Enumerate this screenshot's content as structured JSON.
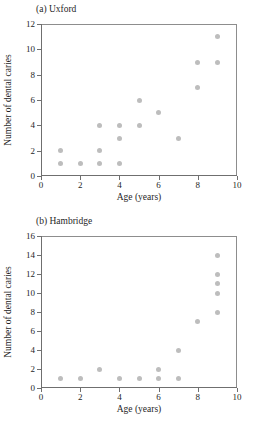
{
  "chart_data": [
    {
      "type": "scatter",
      "title": "(a) Uxford",
      "xlabel": "Age (years)",
      "ylabel": "Number of dental caries",
      "xlim": [
        0,
        10
      ],
      "ylim": [
        0,
        12
      ],
      "xticks": [
        0,
        2,
        4,
        6,
        8,
        10
      ],
      "yticks": [
        0,
        2,
        4,
        6,
        8,
        10,
        12
      ],
      "grid": false,
      "legend": "none",
      "marker_color": "#bdbdbd",
      "points": [
        {
          "x": 1,
          "y": 2
        },
        {
          "x": 1,
          "y": 1
        },
        {
          "x": 2,
          "y": 1
        },
        {
          "x": 3,
          "y": 4
        },
        {
          "x": 3,
          "y": 2
        },
        {
          "x": 3,
          "y": 1
        },
        {
          "x": 4,
          "y": 4
        },
        {
          "x": 4,
          "y": 3
        },
        {
          "x": 4,
          "y": 1
        },
        {
          "x": 5,
          "y": 6
        },
        {
          "x": 5,
          "y": 4
        },
        {
          "x": 6,
          "y": 5
        },
        {
          "x": 7,
          "y": 3
        },
        {
          "x": 8,
          "y": 9
        },
        {
          "x": 8,
          "y": 7
        },
        {
          "x": 9,
          "y": 11
        },
        {
          "x": 9,
          "y": 9
        }
      ]
    },
    {
      "type": "scatter",
      "title": "(b) Hambridge",
      "xlabel": "Age (years)",
      "ylabel": "Number of dental caries",
      "xlim": [
        0,
        10
      ],
      "ylim": [
        0,
        16
      ],
      "xticks": [
        0,
        2,
        4,
        6,
        8,
        10
      ],
      "yticks": [
        0,
        2,
        4,
        6,
        8,
        10,
        12,
        14,
        16
      ],
      "grid": false,
      "legend": "none",
      "marker_color": "#bdbdbd",
      "points": [
        {
          "x": 1,
          "y": 1
        },
        {
          "x": 2,
          "y": 1
        },
        {
          "x": 3,
          "y": 2
        },
        {
          "x": 4,
          "y": 1
        },
        {
          "x": 5,
          "y": 1
        },
        {
          "x": 6,
          "y": 2
        },
        {
          "x": 6,
          "y": 1
        },
        {
          "x": 7,
          "y": 4
        },
        {
          "x": 7,
          "y": 1
        },
        {
          "x": 8,
          "y": 7
        },
        {
          "x": 9,
          "y": 14
        },
        {
          "x": 9,
          "y": 12
        },
        {
          "x": 9,
          "y": 11
        },
        {
          "x": 9,
          "y": 10
        },
        {
          "x": 9,
          "y": 8
        }
      ]
    }
  ]
}
